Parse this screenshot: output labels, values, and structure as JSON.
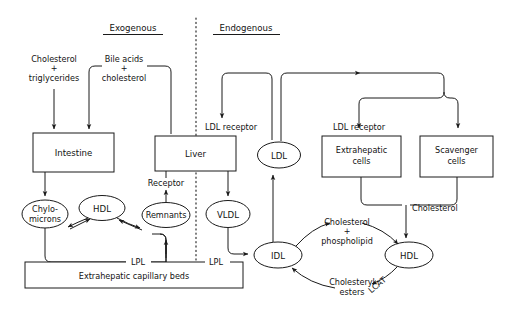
{
  "diagram": {
    "headers": {
      "left": "Exogenous",
      "right": "Endogenous"
    },
    "divider": "vertical-dotted-line",
    "boxes": [
      {
        "id": "intestine",
        "label": "Intestine"
      },
      {
        "id": "liver",
        "label": "Liver"
      },
      {
        "id": "extrahepatic-cells",
        "label_line1": "Extrahepatic",
        "label_line2": "cells"
      },
      {
        "id": "scavenger-cells",
        "label_line1": "Scavenger",
        "label_line2": "cells"
      },
      {
        "id": "capillary-beds",
        "label": "Extrahepatic capillary beds"
      }
    ],
    "ellipses": [
      {
        "id": "chylomicrons",
        "label_line1": "Chylo-",
        "label_line2": "microns"
      },
      {
        "id": "hdl-left",
        "label": "HDL"
      },
      {
        "id": "remnants",
        "label": "Remnants"
      },
      {
        "id": "vldl",
        "label": "VLDL"
      },
      {
        "id": "ldl",
        "label": "LDL"
      },
      {
        "id": "idl",
        "label": "IDL"
      },
      {
        "id": "hdl-right",
        "label": "HDL"
      }
    ],
    "labels": [
      {
        "id": "cholesterol-triglycerides-1",
        "text": "Cholesterol"
      },
      {
        "id": "cholesterol-triglycerides-plus",
        "text": "+"
      },
      {
        "id": "cholesterol-triglycerides-2",
        "text": "triglycerides"
      },
      {
        "id": "bile-acids-1",
        "text": "Bile acids"
      },
      {
        "id": "bile-acids-plus",
        "text": "+"
      },
      {
        "id": "bile-acids-2",
        "text": "cholesterol"
      },
      {
        "id": "ldl-receptor-liver",
        "text": "LDL receptor"
      },
      {
        "id": "ldl-receptor-cells",
        "text": "LDL receptor"
      },
      {
        "id": "receptor-remnants",
        "text": "Receptor"
      },
      {
        "id": "lpl-left",
        "text": "LPL"
      },
      {
        "id": "lpl-right",
        "text": "LPL"
      },
      {
        "id": "chol-phospholipid-1",
        "text": "Cholesterol"
      },
      {
        "id": "chol-phospholipid-plus",
        "text": "+"
      },
      {
        "id": "chol-phospholipid-2",
        "text": "phospholipid"
      },
      {
        "id": "cholesterol-cells",
        "text": "Cholesterol"
      },
      {
        "id": "cholesteryl-esters-1",
        "text": "Cholesteryl"
      },
      {
        "id": "cholesteryl-esters-2",
        "text": "esters"
      },
      {
        "id": "lcat",
        "text": "LCAT"
      }
    ],
    "colors": {
      "ink": "#1a1a1a",
      "text": "#121212",
      "background": "#ffffff"
    }
  }
}
